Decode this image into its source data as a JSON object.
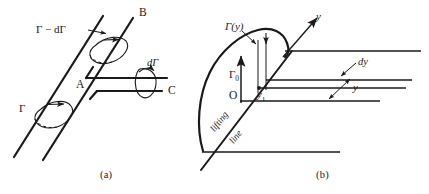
{
  "figure": {
    "stroke_color": "#1a1a1a",
    "background_color": "#ffffff"
  },
  "panel_a": {
    "caption": "(a)",
    "labels": {
      "gamma_minus_dgamma": "Γ − dΓ",
      "gamma": "Γ",
      "dgamma": "dΓ",
      "point_a": "A",
      "point_b": "B",
      "point_c": "C"
    }
  },
  "panel_b": {
    "caption": "(b)",
    "labels": {
      "gamma_of_y": "Γ(y)",
      "gamma_zero": "Γ",
      "gamma_zero_sub": "0",
      "origin": "O",
      "y_one": "y",
      "y_one_sub": "1",
      "dy": "dy",
      "y_span": "y",
      "y_axis": "y",
      "lifting": "lifting",
      "line": "line"
    }
  }
}
